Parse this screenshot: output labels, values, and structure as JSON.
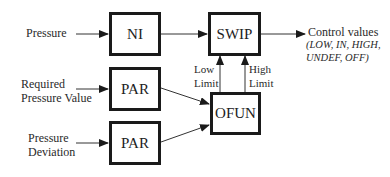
{
  "diagram": {
    "blocks": {
      "ni": "NI",
      "swip": "SWIP",
      "par1": "PAR",
      "par2": "PAR",
      "ofun": "OFUN"
    },
    "inputs": {
      "pressure": "Pressure",
      "required_line1": "Required",
      "required_line2": "Pressure Value",
      "deviation_line1": "Pressure",
      "deviation_line2": "Deviation"
    },
    "limits": {
      "low_line1": "Low",
      "low_line2": "Limit",
      "high_line1": "High",
      "high_line2": "Limit"
    },
    "output": {
      "title": "Control values",
      "values_line1": "(LOW, IN, HIGH,",
      "values_line2": "UNDEF, OFF)"
    },
    "colors": {
      "stroke": "#1a1a1a",
      "background": "#ffffff"
    }
  }
}
